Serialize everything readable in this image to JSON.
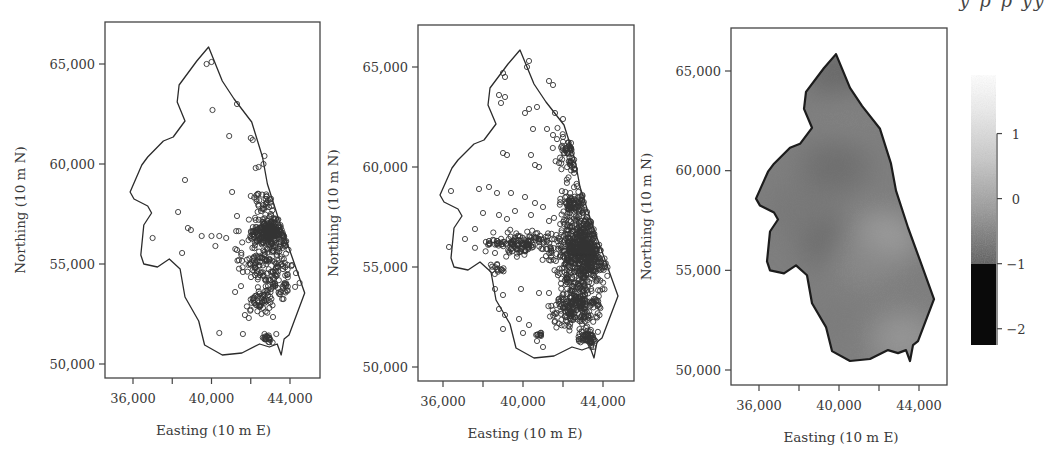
{
  "header_fragment": "y   p        p           yy",
  "chart_data": [
    {
      "type": "scatter",
      "panel": 1,
      "title": "",
      "xlabel": "Easting (10 m E)",
      "ylabel": "Northing (10 m N)",
      "xticks": [
        36000,
        38000,
        40000,
        42000,
        44000
      ],
      "xtick_labels": [
        "36,000",
        "",
        "40,000",
        "",
        "44,000"
      ],
      "yticks": [
        50000,
        55000,
        60000,
        65000
      ],
      "ytick_labels": [
        "50,000",
        "55,000",
        "60,000",
        "65,000"
      ],
      "xlim": [
        34600,
        45500
      ],
      "ylim": [
        49250,
        66950
      ],
      "grid": false,
      "marker": "open-circle",
      "description": "Sparse sample locations, heavily concentrated in the east-central region",
      "points": [
        [
          39750,
          65000
        ],
        [
          40000,
          65100
        ],
        [
          40050,
          62700
        ],
        [
          41300,
          63000
        ],
        [
          40900,
          61400
        ],
        [
          42100,
          61200
        ],
        [
          42000,
          61300
        ],
        [
          42700,
          60400
        ],
        [
          42650,
          60000
        ],
        [
          42400,
          59850
        ],
        [
          42250,
          59800
        ],
        [
          38650,
          59200
        ],
        [
          41050,
          58600
        ],
        [
          42000,
          58400
        ],
        [
          42300,
          58450
        ],
        [
          42400,
          57900
        ],
        [
          38300,
          57600
        ],
        [
          41300,
          57400
        ],
        [
          38950,
          56700
        ],
        [
          38800,
          56800
        ],
        [
          39500,
          56400
        ],
        [
          40000,
          56400
        ],
        [
          40400,
          56400
        ],
        [
          40750,
          56300
        ],
        [
          37000,
          56300
        ],
        [
          38500,
          55550
        ],
        [
          40200,
          55900
        ],
        [
          41300,
          55700
        ],
        [
          41600,
          54600
        ],
        [
          41200,
          53600
        ],
        [
          41700,
          52450
        ],
        [
          41900,
          52300
        ],
        [
          40400,
          51550
        ],
        [
          41600,
          51500
        ],
        [
          42700,
          51500
        ],
        [
          43300,
          51500
        ],
        [
          42550,
          52500
        ]
      ],
      "clusters": [
        {
          "cx": 43000,
          "cy": 56600,
          "sx": 900,
          "sy": 600,
          "n": 260
        },
        {
          "cx": 42800,
          "cy": 55000,
          "sx": 1100,
          "sy": 800,
          "n": 120
        },
        {
          "cx": 43500,
          "cy": 54000,
          "sx": 800,
          "sy": 500,
          "n": 50
        },
        {
          "cx": 42600,
          "cy": 53100,
          "sx": 700,
          "sy": 600,
          "n": 50
        },
        {
          "cx": 42900,
          "cy": 51300,
          "sx": 250,
          "sy": 200,
          "n": 20
        },
        {
          "cx": 42800,
          "cy": 58100,
          "sx": 350,
          "sy": 300,
          "n": 25
        }
      ]
    },
    {
      "type": "scatter",
      "panel": 2,
      "title": "",
      "xlabel": "Easting (10 m E)",
      "ylabel": "Northing (10 m N)",
      "xticks": [
        36000,
        38000,
        40000,
        42000,
        44000
      ],
      "xtick_labels": [
        "36,000",
        "",
        "40,000",
        "",
        "44,000"
      ],
      "yticks": [
        50000,
        55000,
        60000,
        65000
      ],
      "ytick_labels": [
        "50,000",
        "55,000",
        "60,000",
        "65,000"
      ],
      "xlim": [
        34600,
        45500
      ],
      "ylim": [
        49250,
        66950
      ],
      "grid": false,
      "marker": "open-circle",
      "description": "Dense sample locations across the region, very dense in the east and south-east",
      "points": [
        [
          36400,
          58800
        ],
        [
          40200,
          65000
        ],
        [
          40300,
          65300
        ],
        [
          39000,
          64700
        ],
        [
          39100,
          64500
        ],
        [
          41300,
          64300
        ],
        [
          41500,
          64100
        ],
        [
          38800,
          63600
        ],
        [
          39100,
          63500
        ],
        [
          38900,
          63200
        ],
        [
          40300,
          62900
        ],
        [
          40700,
          63000
        ],
        [
          41600,
          62700
        ],
        [
          42000,
          62400
        ],
        [
          40100,
          62700
        ],
        [
          40500,
          61900
        ],
        [
          41200,
          61900
        ],
        [
          41500,
          61600
        ],
        [
          42000,
          61500
        ],
        [
          42400,
          61200
        ],
        [
          39000,
          60700
        ],
        [
          39200,
          60600
        ],
        [
          40400,
          60600
        ],
        [
          40800,
          60000
        ],
        [
          40600,
          60100
        ],
        [
          41800,
          60200
        ],
        [
          42400,
          60300
        ],
        [
          42600,
          59900
        ],
        [
          37800,
          58900
        ],
        [
          38300,
          59000
        ],
        [
          38700,
          58700
        ],
        [
          39400,
          58700
        ],
        [
          40100,
          58500
        ],
        [
          40600,
          58200
        ],
        [
          41000,
          58000
        ],
        [
          41300,
          57300
        ],
        [
          38000,
          57700
        ],
        [
          38800,
          57600
        ],
        [
          39200,
          57400
        ],
        [
          39600,
          57800
        ],
        [
          40400,
          57600
        ],
        [
          37600,
          56900
        ],
        [
          38300,
          56300
        ],
        [
          37100,
          56400
        ],
        [
          36300,
          56000
        ],
        [
          39600,
          56000
        ],
        [
          40100,
          55800
        ],
        [
          38600,
          55700
        ],
        [
          38600,
          53900
        ],
        [
          39000,
          53600
        ],
        [
          38800,
          52900
        ],
        [
          39100,
          52600
        ],
        [
          39800,
          52400
        ],
        [
          40300,
          52100
        ],
        [
          39000,
          51900
        ],
        [
          40000,
          51700
        ],
        [
          40700,
          51300
        ],
        [
          41000,
          51000
        ],
        [
          40800,
          53700
        ],
        [
          41300,
          53700
        ],
        [
          39900,
          53900
        ],
        [
          41600,
          52300
        ]
      ],
      "clusters": [
        {
          "cx": 43000,
          "cy": 55800,
          "sx": 1100,
          "sy": 1500,
          "n": 650
        },
        {
          "cx": 42700,
          "cy": 53000,
          "sx": 900,
          "sy": 900,
          "n": 230
        },
        {
          "cx": 43200,
          "cy": 51500,
          "sx": 350,
          "sy": 350,
          "n": 60
        },
        {
          "cx": 42600,
          "cy": 58200,
          "sx": 500,
          "sy": 500,
          "n": 80
        },
        {
          "cx": 39800,
          "cy": 56200,
          "sx": 1500,
          "sy": 500,
          "n": 150
        },
        {
          "cx": 42300,
          "cy": 60800,
          "sx": 500,
          "sy": 1100,
          "n": 60
        },
        {
          "cx": 40600,
          "cy": 65300,
          "sx": 150,
          "sy": 150,
          "n": 12
        },
        {
          "cx": 40800,
          "cy": 51600,
          "sx": 150,
          "sy": 120,
          "n": 10
        },
        {
          "cx": 38700,
          "cy": 54900,
          "sx": 300,
          "sy": 200,
          "n": 15
        }
      ]
    },
    {
      "type": "heatmap",
      "panel": 3,
      "title": "",
      "xlabel": "Easting (10 m E)",
      "ylabel": "Northing (10 m N)",
      "xticks": [
        36000,
        38000,
        40000,
        42000,
        44000
      ],
      "xtick_labels": [
        "36,000",
        "",
        "40,000",
        "",
        "44,000"
      ],
      "yticks": [
        50000,
        55000,
        60000,
        65000
      ],
      "ytick_labels": [
        "50,000",
        "55,000",
        "60,000",
        "65,000"
      ],
      "xlim": [
        34600,
        45500
      ],
      "ylim": [
        49250,
        66950
      ],
      "grid": false,
      "colorscale": "grayscale (dark = low, light = high)",
      "colorbar": {
        "ticks": [
          1,
          0,
          -1,
          -2
        ],
        "tick_labels": [
          "1",
          "0",
          "−1",
          "−2"
        ],
        "range": [
          -2.25,
          1.9
        ],
        "note": "Values below -1 rendered solid black"
      },
      "surface_description": "Interpolated field mostly between about -0.8 and 0; darker at the northern tip and along a central west-east band; lighter patches in the south-east centre near (42000, 56000) and near (43000, 51500)",
      "hotspots": [
        {
          "e": 40100,
          "n": 64800,
          "value": -0.9
        },
        {
          "e": 39800,
          "n": 60200,
          "value": -0.8
        },
        {
          "e": 39800,
          "n": 56300,
          "value": -0.85
        },
        {
          "e": 42200,
          "n": 56600,
          "value": 0.1
        },
        {
          "e": 41200,
          "n": 55500,
          "value": -0.3
        },
        {
          "e": 43200,
          "n": 51600,
          "value": -0.05
        },
        {
          "e": 40500,
          "n": 62800,
          "value": -0.45
        },
        {
          "e": 37800,
          "n": 58000,
          "value": -0.6
        },
        {
          "e": 40200,
          "n": 52500,
          "value": -0.55
        }
      ],
      "base_value": -0.5
    }
  ],
  "boundary": [
    [
      39850,
      65850
    ],
    [
      39250,
      65150
    ],
    [
      38350,
      63950
    ],
    [
      38250,
      63100
    ],
    [
      38650,
      62150
    ],
    [
      38050,
      61350
    ],
    [
      37550,
      61150
    ],
    [
      36750,
      60350
    ],
    [
      36450,
      59950
    ],
    [
      35850,
      58600
    ],
    [
      36050,
      58250
    ],
    [
      36750,
      57900
    ],
    [
      36950,
      57550
    ],
    [
      36550,
      56950
    ],
    [
      36400,
      55450
    ],
    [
      36550,
      55000
    ],
    [
      37250,
      54850
    ],
    [
      37850,
      55250
    ],
    [
      38400,
      54750
    ],
    [
      38650,
      53350
    ],
    [
      39350,
      52150
    ],
    [
      39650,
      50950
    ],
    [
      40550,
      50450
    ],
    [
      41550,
      50550
    ],
    [
      42450,
      51000
    ],
    [
      42950,
      50850
    ],
    [
      43350,
      51000
    ],
    [
      43550,
      50450
    ],
    [
      43700,
      51250
    ],
    [
      43950,
      51450
    ],
    [
      44750,
      53550
    ],
    [
      44050,
      55500
    ],
    [
      43450,
      57150
    ],
    [
      42850,
      59000
    ],
    [
      42600,
      60350
    ],
    [
      42050,
      62100
    ],
    [
      41150,
      63250
    ],
    [
      40550,
      64150
    ]
  ],
  "panels_layout": [
    {
      "frame": [
        105,
        22,
        320,
        378
      ],
      "x36k": 133,
      "x44k": 290,
      "y65k": 64,
      "y50k": 364
    },
    {
      "frame": [
        418,
        25,
        634,
        381
      ],
      "x36k": 443,
      "x44k": 603,
      "y65k": 67,
      "y50k": 367
    },
    {
      "frame": [
        731,
        28,
        947,
        385
      ],
      "x36k": 759,
      "x44k": 919,
      "y65k": 71,
      "y50k": 370
    }
  ]
}
